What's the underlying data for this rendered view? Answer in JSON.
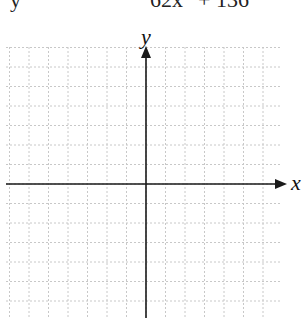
{
  "equation": {
    "left": "y",
    "middle": "62x",
    "right": "+ 136",
    "note": "top line partially cropped"
  },
  "graph": {
    "x_label": "x",
    "y_label": "y",
    "grid": {
      "origin_px": [
        146,
        184
      ],
      "spacing_px": 19.5,
      "left_px": 6,
      "right_px": 282,
      "top_px": 47,
      "bottom_px": 318,
      "line_color": "#c8c8c8",
      "axis_color": "#1a1a1a"
    }
  }
}
